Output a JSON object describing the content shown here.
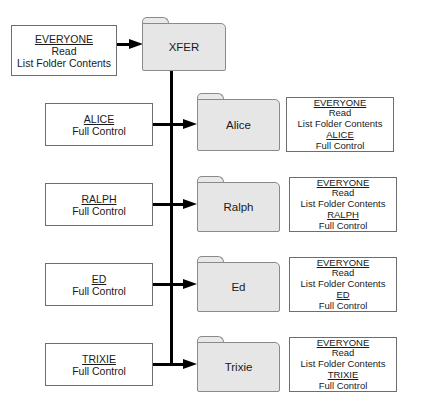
{
  "root": {
    "folder": "XFER",
    "acl": {
      "principal": "EVERYONE",
      "permissions": [
        "Read",
        "List Folder Contents"
      ]
    }
  },
  "subfolders": [
    {
      "folder": "Alice",
      "user": "ALICE",
      "user_permission": "Full Control",
      "effective": {
        "inherited_principal": "EVERYONE",
        "inherited_permissions": [
          "Read",
          "List Folder Contents"
        ],
        "user": "ALICE",
        "user_permission": "Full Control"
      }
    },
    {
      "folder": "Ralph",
      "user": "RALPH",
      "user_permission": "Full Control",
      "effective": {
        "inherited_principal": "EVERYONE",
        "inherited_permissions": [
          "Read",
          "List Folder Contents"
        ],
        "user": "RALPH",
        "user_permission": "Full Control"
      }
    },
    {
      "folder": "Ed",
      "user": "ED",
      "user_permission": "Full Control",
      "effective": {
        "inherited_principal": "EVERYONE",
        "inherited_permissions": [
          "Read",
          "List Folder Contents"
        ],
        "user": "ED",
        "user_permission": "Full Control"
      }
    },
    {
      "folder": "Trixie",
      "user": "TRIXIE",
      "user_permission": "Full Control",
      "effective": {
        "inherited_principal": "EVERYONE",
        "inherited_permissions": [
          "Read",
          "List Folder Contents"
        ],
        "user": "TRIXIE",
        "user_permission": "Full Control"
      }
    }
  ],
  "colors": {
    "folder_fill": "#e6e6e6",
    "folder_border": "#8a8a8a",
    "connector": "#000000",
    "box_border": "#6e6e6e"
  }
}
